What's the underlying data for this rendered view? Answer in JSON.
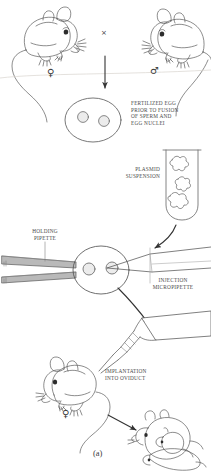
{
  "figure": {
    "caption": "(a)",
    "caption_name": "panel-label-a",
    "topic": "Production of transgenic mice by pronuclear microinjection"
  },
  "labels": {
    "fertilized_egg": "Fertilized egg\nprior to fusion\nof sperm and\negg nuclei",
    "plasmid_suspension": "Plasmid\nsuspension",
    "holding_pipette": "Holding\npipette",
    "injection_micropipette": "Injection\nmicropipette",
    "implantation": "Implantation\ninto oviduct"
  },
  "symbols": {
    "cross": "×",
    "female": "♀",
    "male": "♂"
  },
  "steps": [
    {
      "id": "mating",
      "label": "Mating of female and male mice"
    },
    {
      "id": "fertilized-egg",
      "label": "Fertilized egg prior to fusion of sperm and egg nuclei"
    },
    {
      "id": "plasmid-loading",
      "label": "Plasmid suspension drawn into micropipette"
    },
    {
      "id": "microinjection",
      "label": "Microinjection into pronucleus while egg is held by holding pipette"
    },
    {
      "id": "implantation",
      "label": "Implantation into oviduct of recipient female"
    },
    {
      "id": "offspring",
      "label": "Litter of pups born to recipient female"
    }
  ],
  "colors": {
    "ink": "#3a3a3a",
    "label_text": "#4a4a4a",
    "line": "#555555",
    "pipette_fill": "#b9b9b9",
    "pipette_fill_light": "#d4d4d4",
    "background": "#ffffff"
  }
}
